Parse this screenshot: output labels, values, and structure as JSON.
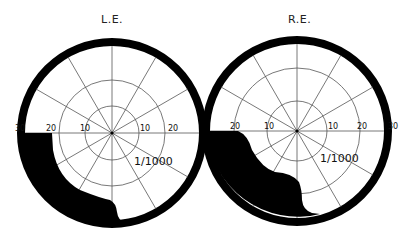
{
  "figure": {
    "left_eye": {
      "title": "L.E.",
      "isopter_label": "1/1000",
      "axis_labels": [
        "30",
        "20",
        "10",
        "10",
        "20"
      ],
      "scotoma": "inferior temporal field loss (lower-left quadrant)"
    },
    "right_eye": {
      "title": "R.E.",
      "isopter_label": "1/1000",
      "axis_labels": [
        "20",
        "10",
        "10",
        "20",
        "30"
      ],
      "scotoma": "inferior nasal field loss (lower-left quadrant)"
    },
    "grid": {
      "rings_degrees": [
        10,
        20,
        30
      ],
      "meridians": 12
    },
    "colors": {
      "background": "#ffffff",
      "field_loss": "#000000",
      "grid": "#555555"
    }
  }
}
